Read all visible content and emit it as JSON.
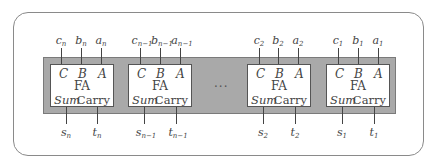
{
  "diagram": {
    "type": "ripple-adder-block-diagram",
    "ellipsis": "···",
    "units": [
      {
        "name": "FA",
        "port_c": "C",
        "port_b": "B",
        "port_a": "A",
        "out_sum": "Sum",
        "out_carry": "Carry",
        "in_c": "c",
        "in_c_sub": "n",
        "in_b": "b",
        "in_b_sub": "n",
        "in_a": "a",
        "in_a_sub": "n",
        "out_s": "s",
        "out_s_sub": "n",
        "out_t": "t",
        "out_t_sub": "n"
      },
      {
        "name": "FA",
        "port_c": "C",
        "port_b": "B",
        "port_a": "A",
        "out_sum": "Sum",
        "out_carry": "Carry",
        "in_c": "c",
        "in_c_sub": "n−1",
        "in_b": "b",
        "in_b_sub": "n−1",
        "in_a": "a",
        "in_a_sub": "n−1",
        "out_s": "s",
        "out_s_sub": "n−1",
        "out_t": "t",
        "out_t_sub": "n−1"
      },
      {
        "name": "FA",
        "port_c": "C",
        "port_b": "B",
        "port_a": "A",
        "out_sum": "Sum",
        "out_carry": "Carry",
        "in_c": "c",
        "in_c_sub": "2",
        "in_b": "b",
        "in_b_sub": "2",
        "in_a": "a",
        "in_a_sub": "2",
        "out_s": "s",
        "out_s_sub": "2",
        "out_t": "t",
        "out_t_sub": "2"
      },
      {
        "name": "FA",
        "port_c": "C",
        "port_b": "B",
        "port_a": "A",
        "out_sum": "Sum",
        "out_carry": "Carry",
        "in_c": "c",
        "in_c_sub": "1",
        "in_b": "b",
        "in_b_sub": "1",
        "in_a": "a",
        "in_a_sub": "1",
        "out_s": "s",
        "out_s_sub": "1",
        "out_t": "t",
        "out_t_sub": "1"
      }
    ]
  },
  "colors": {
    "band": "#a9a9a9",
    "box": "#ffffff",
    "line": "#444444"
  }
}
